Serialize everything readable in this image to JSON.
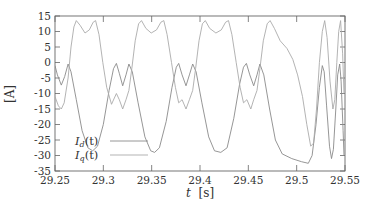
{
  "chart_data": {
    "type": "line",
    "title": "",
    "xlabel": "t [s]",
    "xlabel_italic_part": "t",
    "xlabel_unit": "[s]",
    "ylabel": "[A]",
    "xlim": [
      29.25,
      29.55
    ],
    "ylim": [
      -35,
      15
    ],
    "x_ticks": [
      "29.25",
      "29.3",
      "29.35",
      "29.4",
      "29.45",
      "29.5",
      "29.55"
    ],
    "y_ticks": [
      "15",
      "10",
      "5",
      "0",
      "-5",
      "-10",
      "-15",
      "-20",
      "-25",
      "-30",
      "-35"
    ],
    "grid": false,
    "legend_position": "lower-left (inside)",
    "series": [
      {
        "name": "I_d(t)",
        "label_main": "I",
        "label_sub": "d",
        "label_arg": "(t)",
        "color": "#8a8a8a",
        "points": [
          [
            29.25,
            -1
          ],
          [
            29.2525,
            -4
          ],
          [
            29.2565,
            -7.3
          ],
          [
            29.26,
            -4.5
          ],
          [
            29.2635,
            -0.5
          ],
          [
            29.2665,
            -3
          ],
          [
            29.272,
            -12
          ],
          [
            29.278,
            -22
          ],
          [
            29.284,
            -27.5
          ],
          [
            29.289,
            -28.5
          ],
          [
            29.294,
            -27
          ],
          [
            29.3,
            -20
          ],
          [
            29.306,
            -9
          ],
          [
            29.3105,
            -2
          ],
          [
            29.3135,
            -0.3
          ],
          [
            29.3165,
            -3.5
          ],
          [
            29.32,
            -7.5
          ],
          [
            29.3235,
            -4
          ],
          [
            29.3265,
            -0.5
          ],
          [
            29.33,
            -3
          ],
          [
            29.336,
            -13
          ],
          [
            29.343,
            -24
          ],
          [
            29.349,
            -28.5
          ],
          [
            29.353,
            -29
          ],
          [
            29.358,
            -27.5
          ],
          [
            29.365,
            -19
          ],
          [
            29.371,
            -8
          ],
          [
            29.3755,
            -1.5
          ],
          [
            29.378,
            -0.3
          ],
          [
            29.3815,
            -4
          ],
          [
            29.3855,
            -7.5
          ],
          [
            29.389,
            -4
          ],
          [
            29.3925,
            -0.5
          ],
          [
            29.396,
            -3
          ],
          [
            29.402,
            -13
          ],
          [
            29.409,
            -24
          ],
          [
            29.415,
            -28.5
          ],
          [
            29.4215,
            -29
          ],
          [
            29.428,
            -27.5
          ],
          [
            29.435,
            -18
          ],
          [
            29.441,
            -7
          ],
          [
            29.445,
            -1.5
          ],
          [
            29.448,
            -0.3
          ],
          [
            29.4515,
            -4
          ],
          [
            29.4555,
            -7.5
          ],
          [
            29.459,
            -4
          ],
          [
            29.462,
            -0.5
          ],
          [
            29.466,
            -4
          ],
          [
            29.472,
            -15
          ],
          [
            29.478,
            -25
          ],
          [
            29.485,
            -29.5
          ],
          [
            29.495,
            -31
          ],
          [
            29.505,
            -32
          ],
          [
            29.512,
            -32.5
          ],
          [
            29.516,
            -30
          ],
          [
            29.52,
            -20
          ],
          [
            29.5235,
            -8
          ],
          [
            29.5265,
            -1
          ],
          [
            29.5285,
            -3
          ],
          [
            29.531,
            -14
          ],
          [
            29.534,
            -27
          ],
          [
            29.536,
            -31
          ],
          [
            29.538,
            -28
          ],
          [
            29.5405,
            -15
          ],
          [
            29.5425,
            -4
          ],
          [
            29.5445,
            -0.5
          ],
          [
            29.546,
            -6
          ],
          [
            29.548,
            -22
          ],
          [
            29.549,
            -30
          ]
        ]
      },
      {
        "name": "I_q(t)",
        "label_main": "I",
        "label_sub": "q",
        "label_arg": "(t)",
        "color": "#aaaaaa",
        "points": [
          [
            29.25,
            -11
          ],
          [
            29.2535,
            -14
          ],
          [
            29.2565,
            -15
          ],
          [
            29.2595,
            -13
          ],
          [
            29.2635,
            -5
          ],
          [
            29.2665,
            5
          ],
          [
            29.2695,
            11.5
          ],
          [
            29.272,
            13.5
          ],
          [
            29.276,
            12
          ],
          [
            29.281,
            9.5
          ],
          [
            29.2855,
            10.5
          ],
          [
            29.2895,
            13
          ],
          [
            29.292,
            13.5
          ],
          [
            29.2955,
            9
          ],
          [
            29.2995,
            0
          ],
          [
            29.3035,
            -8
          ],
          [
            29.3085,
            -13.5
          ],
          [
            29.3135,
            -10
          ],
          [
            29.3165,
            -12
          ],
          [
            29.32,
            -15
          ],
          [
            29.3235,
            -12
          ],
          [
            29.3265,
            -9
          ],
          [
            29.3295,
            -2
          ],
          [
            29.333,
            7
          ],
          [
            29.3365,
            12.5
          ],
          [
            29.3395,
            13.5
          ],
          [
            29.344,
            11
          ],
          [
            29.3495,
            9.5
          ],
          [
            29.355,
            10.5
          ],
          [
            29.3595,
            13
          ],
          [
            29.3625,
            13.5
          ],
          [
            29.366,
            9
          ],
          [
            29.3705,
            0
          ],
          [
            29.3745,
            -8
          ],
          [
            29.378,
            -13
          ],
          [
            29.3815,
            -12
          ],
          [
            29.3855,
            -15
          ],
          [
            29.389,
            -12
          ],
          [
            29.3925,
            -9
          ],
          [
            29.3955,
            -2
          ],
          [
            29.399,
            7
          ],
          [
            29.4025,
            12.5
          ],
          [
            29.4055,
            13.5
          ],
          [
            29.41,
            11
          ],
          [
            29.4165,
            9.5
          ],
          [
            29.422,
            10.5
          ],
          [
            29.4265,
            13
          ],
          [
            29.4295,
            13.5
          ],
          [
            29.433,
            9
          ],
          [
            29.4375,
            0
          ],
          [
            29.4415,
            -8
          ],
          [
            29.445,
            -13
          ],
          [
            29.4485,
            -12
          ],
          [
            29.4525,
            -15
          ],
          [
            29.4555,
            -12
          ],
          [
            29.459,
            -9
          ],
          [
            29.462,
            -2
          ],
          [
            29.4655,
            7
          ],
          [
            29.4695,
            12.5
          ],
          [
            29.4725,
            13.5
          ],
          [
            29.477,
            11
          ],
          [
            29.483,
            7
          ],
          [
            29.49,
            4.5
          ],
          [
            29.496,
            1
          ],
          [
            29.501,
            -4
          ],
          [
            29.506,
            -11
          ],
          [
            29.5105,
            -20
          ],
          [
            29.5145,
            -27
          ],
          [
            29.5175,
            -26
          ],
          [
            29.5205,
            -15
          ],
          [
            29.5235,
            0
          ],
          [
            29.5265,
            10
          ],
          [
            29.529,
            13.5
          ],
          [
            29.5315,
            8
          ],
          [
            29.5345,
            -6
          ],
          [
            29.5375,
            -15
          ],
          [
            29.5395,
            -12
          ],
          [
            29.5415,
            0
          ],
          [
            29.5435,
            10
          ],
          [
            29.5455,
            13.5
          ],
          [
            29.5475,
            3
          ],
          [
            29.549,
            -10
          ]
        ]
      }
    ]
  },
  "axes": {
    "ylabel": "[A]",
    "xlabel_t": "t",
    "xlabel_unit": "[s]"
  },
  "legend": {
    "items": [
      {
        "main": "I",
        "sub": "d",
        "arg": "(t)"
      },
      {
        "main": "I",
        "sub": "q",
        "arg": "(t)"
      }
    ]
  }
}
